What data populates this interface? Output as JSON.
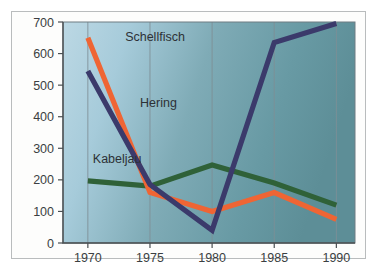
{
  "chart_data": {
    "type": "line",
    "title": "",
    "subtitle": "",
    "xlabel": "",
    "ylabel": "",
    "categories": [
      "1970",
      "1975",
      "1980",
      "1985",
      "1990"
    ],
    "x": [
      1970,
      1975,
      1980,
      1985,
      1990
    ],
    "xlim": [
      1968,
      1991.5
    ],
    "ylim": [
      0,
      700
    ],
    "yticks": [
      "0",
      "100",
      "200",
      "300",
      "400",
      "500",
      "600",
      "700"
    ],
    "ytick_values": [
      0,
      100,
      200,
      300,
      400,
      500,
      600,
      700
    ],
    "grid": "vertical",
    "legend": "inline-labels",
    "series": [
      {
        "name": "Schellfisch",
        "color": "#ef6534",
        "values": [
          650,
          160,
          100,
          160,
          75
        ],
        "label_x": 1973.0,
        "label_y": 640
      },
      {
        "name": "Hering",
        "color": "#3b3a6b",
        "values": [
          545,
          185,
          40,
          635,
          695
        ],
        "label_x": 1974.2,
        "label_y": 430
      },
      {
        "name": "Kabeljau",
        "color": "#2f6138",
        "values": [
          197,
          180,
          247,
          190,
          120
        ],
        "label_x": 1970.4,
        "label_y": 252
      }
    ]
  },
  "plot": {
    "background_left": "#b6d4e2",
    "background_right": "#5f9099",
    "gridline_color": "#7f8f96",
    "axis_color": "#4a4f52",
    "card_background": "#fdfdfc",
    "card_border": "#b9bcbd"
  }
}
